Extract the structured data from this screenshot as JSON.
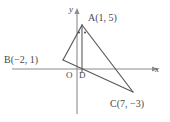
{
  "figure": {
    "kind": "coordinate-geometry-diagram",
    "stroke_color": "#5a5a5a",
    "axis_color": "#8c8c8c",
    "text_color": "#4a4a4a",
    "background_color": "#ffffff"
  },
  "axes": {
    "x_label": "x",
    "y_label": "y",
    "origin_label": "O",
    "x_axis_pixel_y": 69,
    "y_axis_pixel_x": 77
  },
  "points": {
    "A": {
      "label": "A(1, 5)",
      "name": "A",
      "x": 1,
      "y": 5,
      "px": 82,
      "py": 25
    },
    "B": {
      "label": "B(−2, 1)",
      "name": "B",
      "x": -2,
      "y": 1,
      "px": 63,
      "py": 60
    },
    "C": {
      "label": "C(7, −3)",
      "name": "C",
      "x": 7,
      "y": -3,
      "px": 133,
      "py": 92
    },
    "D": {
      "label": "D",
      "name": "D",
      "x": 1,
      "y": 0,
      "px": 82,
      "py": 69
    },
    "O": {
      "label": "O",
      "name": "O",
      "x": 0,
      "y": 0,
      "px": 77,
      "py": 69
    }
  },
  "segments": [
    {
      "name": "AB",
      "from": "A",
      "to": "B"
    },
    {
      "name": "AC",
      "from": "A",
      "to": "C"
    },
    {
      "name": "BC",
      "from": "B",
      "to": "C"
    },
    {
      "name": "AD",
      "from": "A",
      "to": "D"
    }
  ],
  "angle_marks": {
    "vertex": "A",
    "style": "dot",
    "count": 2,
    "meaning": "equal angles BAD and DAC"
  }
}
